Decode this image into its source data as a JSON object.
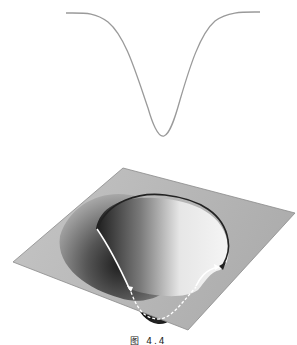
{
  "figure": {
    "caption": "图 4.4",
    "top_plot": {
      "description": "1D potential well profile (inverted Gaussian)",
      "line_color": "#9a9a9a"
    },
    "surface": {
      "description": "3D surface with funnel-shaped well and path around it",
      "plane_color": "#b4b4b4",
      "well_dark": "#1a1a1a",
      "path_solid_color": "#222222",
      "path_white_color": "#ffffff",
      "path_dashed_color": "#ffffff"
    }
  }
}
